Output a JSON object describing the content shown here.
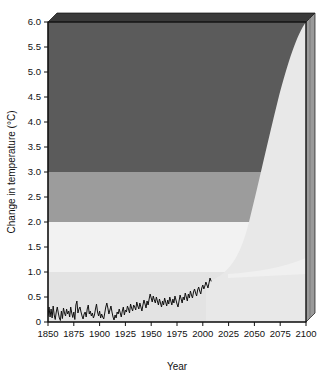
{
  "chart_data": {
    "type": "area",
    "title": "",
    "subtitle": "",
    "xlabel": "Year",
    "ylabel": "Change in temperature (°C)",
    "xlim": [
      1850,
      2100
    ],
    "ylim": [
      0,
      6.0
    ],
    "grid": false,
    "legend_position": "none",
    "xticks": [
      1850,
      1875,
      1900,
      1925,
      1950,
      1975,
      2000,
      2025,
      2050,
      2075,
      2100
    ],
    "xtick_labels": [
      "1850",
      "1875",
      "1900",
      "1925",
      "1950",
      "1975",
      "2000",
      "2025",
      "2050",
      "2075",
      "2100"
    ],
    "yticks": [
      0,
      0.5,
      1.0,
      1.5,
      2.0,
      2.5,
      3.0,
      3.5,
      4.0,
      4.5,
      5.0,
      5.5,
      6.0
    ],
    "ytick_labels": [
      "0",
      "0.5",
      "1.0",
      "1.5",
      "2.0",
      "2.5",
      "3.0",
      "3.5",
      "4.0",
      "4.5",
      "5.0",
      "5.5",
      "6.0"
    ],
    "bands": [
      {
        "name": "band-0-1",
        "from": 0,
        "to": 1.0,
        "color": "#e3e3e3"
      },
      {
        "name": "band-1-2",
        "from": 1.0,
        "to": 2.0,
        "color": "#f2f2f2"
      },
      {
        "name": "band-2-3",
        "from": 2.0,
        "to": 3.0,
        "color": "#9c9c9c"
      },
      {
        "name": "band-3-6",
        "from": 3.0,
        "to": 6.0,
        "color": "#5b5b5b"
      }
    ],
    "projection_wedge": {
      "name": "projection-upper-envelope",
      "color": "#e8e8e8",
      "description": "Light projection cone rising from about 2000 to 2100",
      "points": [
        {
          "x": 2000,
          "y": 0.8
        },
        {
          "x": 2020,
          "y": 1.2
        },
        {
          "x": 2040,
          "y": 2.0
        },
        {
          "x": 2055,
          "y": 2.7
        },
        {
          "x": 2065,
          "y": 3.4
        },
        {
          "x": 2075,
          "y": 4.2
        },
        {
          "x": 2085,
          "y": 5.0
        },
        {
          "x": 2095,
          "y": 5.7
        },
        {
          "x": 2100,
          "y": 6.0
        }
      ]
    },
    "projection_lower_wedge": {
      "name": "projection-lower-envelope",
      "color": "#f0f0f0",
      "points": [
        {
          "x": 2020,
          "y": 0.95
        },
        {
          "x": 2060,
          "y": 1.05
        },
        {
          "x": 2100,
          "y": 1.35
        }
      ]
    },
    "series": [
      {
        "name": "Observed global mean temperature change",
        "color": "#111111",
        "x_start": 1850,
        "x_end": 2008,
        "values": [
          0.12,
          0.3,
          0.1,
          0.26,
          0.08,
          0.32,
          0.14,
          0.05,
          0.2,
          0.3,
          0.18,
          0.08,
          0.03,
          0.22,
          0.07,
          0.28,
          0.18,
          0.12,
          0.26,
          0.16,
          0.22,
          0.1,
          0.3,
          0.18,
          0.09,
          0.2,
          0.05,
          0.34,
          0.42,
          0.18,
          0.26,
          0.3,
          0.2,
          0.12,
          0.06,
          0.16,
          0.2,
          0.1,
          0.26,
          0.34,
          0.16,
          0.22,
          0.12,
          0.18,
          0.08,
          0.14,
          0.26,
          0.36,
          0.2,
          0.12,
          0.22,
          0.08,
          0.16,
          0.1,
          0.06,
          0.18,
          0.3,
          0.38,
          0.28,
          0.16,
          0.24,
          0.32,
          0.2,
          0.1,
          0.04,
          0.14,
          0.08,
          0.2,
          0.16,
          0.26,
          0.18,
          0.1,
          0.22,
          0.3,
          0.14,
          0.24,
          0.2,
          0.32,
          0.26,
          0.18,
          0.36,
          0.28,
          0.22,
          0.34,
          0.3,
          0.24,
          0.4,
          0.32,
          0.26,
          0.38,
          0.3,
          0.22,
          0.34,
          0.44,
          0.36,
          0.28,
          0.42,
          0.34,
          0.46,
          0.56,
          0.48,
          0.4,
          0.52,
          0.44,
          0.38,
          0.5,
          0.42,
          0.34,
          0.46,
          0.38,
          0.3,
          0.42,
          0.34,
          0.48,
          0.4,
          0.32,
          0.44,
          0.36,
          0.5,
          0.42,
          0.34,
          0.46,
          0.38,
          0.52,
          0.44,
          0.36,
          0.3,
          0.42,
          0.54,
          0.46,
          0.38,
          0.5,
          0.44,
          0.58,
          0.5,
          0.42,
          0.56,
          0.48,
          0.62,
          0.54,
          0.48,
          0.6,
          0.66,
          0.58,
          0.52,
          0.64,
          0.7,
          0.62,
          0.56,
          0.68,
          0.74,
          0.66,
          0.72,
          0.8,
          0.74,
          0.68,
          0.78,
          0.88,
          0.82
        ]
      }
    ]
  },
  "axes": {
    "x_axis_name": "Year",
    "y_axis_name": "Change in temperature (°C)"
  },
  "colors": {
    "band_low": "#e3e3e3",
    "band_mid_light": "#f2f2f2",
    "band_mid": "#9c9c9c",
    "band_high": "#5b5b5b",
    "wedge": "#e8e8e8",
    "line": "#111111",
    "top_face": "#3a3a3a",
    "right_face": "#8e8e8e",
    "axis": "#111111"
  }
}
